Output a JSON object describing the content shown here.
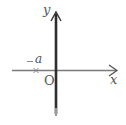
{
  "diagram": {
    "type": "coordinate-axes",
    "axes": {
      "x_label": "x",
      "y_label": "y",
      "origin_label": "O"
    },
    "points": [
      {
        "label": "−a",
        "marker": "×",
        "position": "negative x-axis"
      }
    ],
    "colors": {
      "x_axis": "#777777",
      "y_axis": "#333333",
      "labels": "#555555",
      "marker": "#888888"
    }
  }
}
